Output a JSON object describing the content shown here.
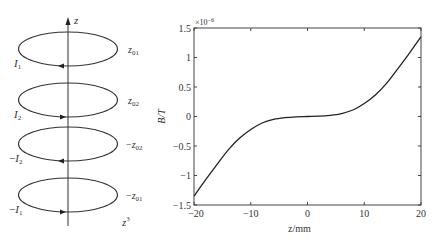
{
  "diagram": {
    "axis_label": "z",
    "loops": [
      {
        "current_label": "I",
        "current_sub": "1",
        "current_sign": "",
        "position_label": "z",
        "position_sub": "01",
        "position_sign": "",
        "arrow_direction": "left"
      },
      {
        "current_label": "I",
        "current_sub": "2",
        "current_sign": "",
        "position_label": "z",
        "position_sub": "02",
        "position_sign": "",
        "arrow_direction": "right"
      },
      {
        "current_label": "I",
        "current_sub": "2",
        "current_sign": "−",
        "position_label": "z",
        "position_sub": "02",
        "position_sign": "−",
        "arrow_direction": "left"
      },
      {
        "current_label": "I",
        "current_sub": "1",
        "current_sign": "−",
        "position_label": "z",
        "position_sub": "01",
        "position_sign": "−",
        "arrow_direction": "right"
      }
    ],
    "field_form_label": "z",
    "field_form_exp": "3"
  },
  "chart_data": {
    "type": "line",
    "title": "",
    "xlabel": "z/mm",
    "ylabel": "B/T",
    "y_multiplier": "×10",
    "y_multiplier_exp": "−6",
    "xlim": [
      -20,
      20
    ],
    "ylim": [
      -1.5,
      1.5
    ],
    "xticks": [
      -20,
      -10,
      0,
      10,
      20
    ],
    "xtick_labels": [
      "−20",
      "−10",
      "0",
      "10",
      "20"
    ],
    "yticks": [
      1.5,
      1,
      0.5,
      0,
      -0.5,
      -1,
      -1.5
    ],
    "ytick_labels": [
      "1.5",
      "1",
      "0.5",
      "0",
      "−0.5",
      "−1",
      "−1.5"
    ],
    "grid": false,
    "legend": null,
    "series": [
      {
        "name": "B(z)",
        "color": "#222222",
        "x": [
          -20,
          -18,
          -16,
          -14,
          -12,
          -10,
          -8,
          -6,
          -4,
          -2,
          0,
          2,
          4,
          6,
          8,
          10,
          12,
          14,
          16,
          18,
          20
        ],
        "y": [
          -1.35,
          -1.08,
          -0.82,
          -0.57,
          -0.37,
          -0.22,
          -0.11,
          -0.05,
          -0.02,
          -0.005,
          0,
          0.005,
          0.02,
          0.05,
          0.11,
          0.22,
          0.37,
          0.57,
          0.82,
          1.08,
          1.35
        ]
      }
    ]
  }
}
